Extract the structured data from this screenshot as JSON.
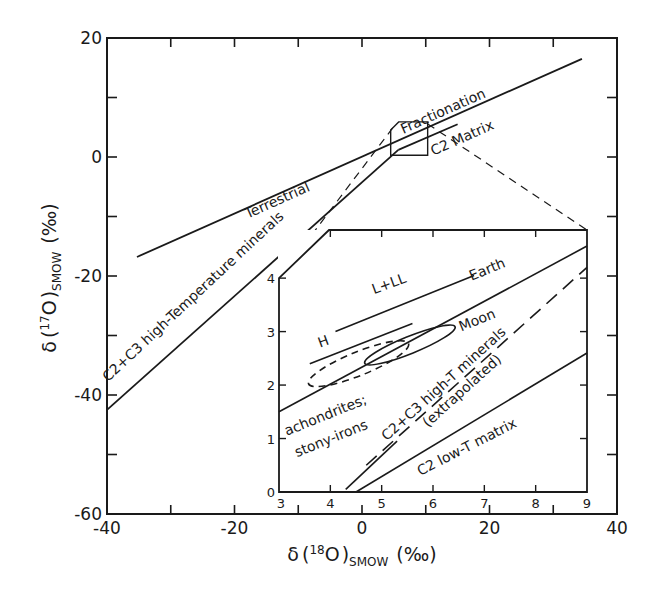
{
  "chart_data": {
    "type": "line",
    "title": "",
    "xlabel": "δ(18O)SMOW (‰)",
    "ylabel": "δ(17O)SMOW (‰)",
    "xlabel_parts": {
      "delta": "δ",
      "open": "(",
      "sup": "18",
      "elem": "O",
      "close": ")",
      "sub": "SMOW",
      "unit": "(‰)"
    },
    "ylabel_parts": {
      "delta": "δ",
      "open": "(",
      "sup": "17",
      "elem": "O",
      "close": ")",
      "sub": "SMOW",
      "unit": "(‰)"
    },
    "xlim": [
      -40,
      40
    ],
    "ylim": [
      -60,
      20
    ],
    "grid": false,
    "x_ticks": [
      -40,
      -20,
      0,
      20,
      40
    ],
    "x_minor_ticks": [
      -30,
      -10,
      10,
      30
    ],
    "y_ticks": [
      20,
      0,
      -20,
      -40,
      -60
    ],
    "y_minor_ticks": [
      10,
      -10,
      -30,
      -50
    ],
    "series": [
      {
        "name": "Terrestrial Fractionation",
        "style": "solid",
        "points": [
          [
            -35.3,
            -16.8
          ],
          [
            34.5,
            16.5
          ]
        ]
      },
      {
        "name": "C2+C3 high-Temperature minerals",
        "style": "solid",
        "points": [
          [
            -40,
            -42.5
          ],
          [
            5.7,
            1.2
          ]
        ]
      },
      {
        "name": "C2 Matrix",
        "style": "solid",
        "points": [
          [
            5.7,
            1.2
          ],
          [
            15,
            5.5
          ]
        ]
      }
    ],
    "annotations": [
      {
        "text": "Terrestrial",
        "x": -13,
        "y": -8,
        "rotation": -24
      },
      {
        "text": "Fractionation",
        "x": 13,
        "y": 7,
        "rotation": -24
      },
      {
        "text": "C2 Matrix",
        "x": 16,
        "y": 2.5,
        "rotation": -24
      },
      {
        "text": "C2+C3 high-Temperature minerals",
        "x": -26,
        "y": -24,
        "rotation": -43
      }
    ],
    "zoom_box": {
      "x": [
        4.5,
        10.3
      ],
      "y": [
        0.3,
        5.9
      ]
    },
    "inset": {
      "xlim": [
        3,
        9
      ],
      "ylim": [
        0,
        4.9
      ],
      "x_ticks": [
        3,
        4,
        5,
        6,
        7,
        8,
        9
      ],
      "y_ticks": [
        0,
        1,
        2,
        3,
        4
      ],
      "series": [
        {
          "name": "Earth",
          "style": "solid",
          "points": [
            [
              3,
              1.5
            ],
            [
              9,
              4.6
            ]
          ]
        },
        {
          "name": "L+LL",
          "style": "solid",
          "points": [
            [
              4.1,
              3.0
            ],
            [
              6.8,
              4.05
            ]
          ]
        },
        {
          "name": "H",
          "style": "solid",
          "points": [
            [
              3.6,
              2.4
            ],
            [
              5.6,
              3.15
            ]
          ]
        },
        {
          "name": "C2+C3 high-T minerals (extrapolated)",
          "style": "dashed",
          "points": [
            [
              4.7,
              0.5
            ],
            [
              9,
              4.2
            ]
          ]
        },
        {
          "name": "C2+C3 high-T minerals",
          "style": "solid",
          "points": [
            [
              4.3,
              0.05
            ],
            [
              5.3,
              0.95
            ]
          ]
        },
        {
          "name": "C2 low-T matrix",
          "style": "solid",
          "points": [
            [
              4.5,
              0.0
            ],
            [
              9,
              2.6
            ]
          ]
        }
      ],
      "regions": [
        {
          "name": "achondrites; stony-irons",
          "style": "dashed",
          "center": [
            4.55,
            2.4
          ],
          "rx": 1.05,
          "ry": 0.22,
          "rotation": -22
        },
        {
          "name": "Moon",
          "style": "solid",
          "center": [
            5.55,
            2.75
          ],
          "rx": 0.95,
          "ry": 0.16,
          "rotation": -22
        }
      ],
      "annotations": [
        {
          "text": "L+LL",
          "x": 4.85,
          "y": 3.7,
          "rotation": -20
        },
        {
          "text": "H",
          "x": 3.8,
          "y": 2.7,
          "rotation": -20
        },
        {
          "text": "Earth",
          "x": 6.75,
          "y": 3.95,
          "rotation": -22
        },
        {
          "text": "Moon",
          "x": 6.55,
          "y": 3.0,
          "rotation": -22
        },
        {
          "text": "achondrites;",
          "x": 3.15,
          "y": 1.05,
          "rotation": -22
        },
        {
          "text": "stony-irons",
          "x": 3.35,
          "y": 0.65,
          "rotation": -22
        },
        {
          "text": "C2+C3 high-T minerals",
          "x": 5.1,
          "y": 0.95,
          "rotation": -42
        },
        {
          "text": "(extrapolated)",
          "x": 5.9,
          "y": 1.2,
          "rotation": -42
        },
        {
          "text": "C2 low-T matrix",
          "x": 5.75,
          "y": 0.3,
          "rotation": -27
        }
      ]
    }
  }
}
